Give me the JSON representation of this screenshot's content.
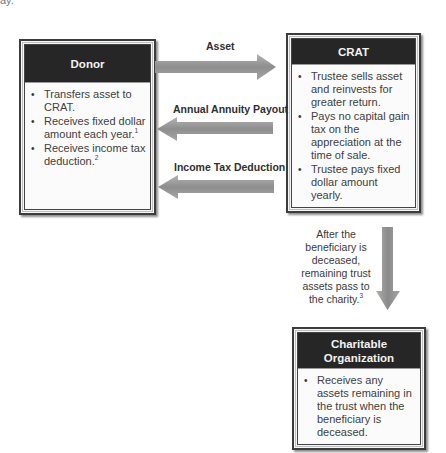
{
  "fragment_text": "ay.",
  "boxes": {
    "donor": {
      "title": "Donor",
      "items": [
        {
          "text": "Transfers asset to CRAT.",
          "sup": ""
        },
        {
          "text": "Receives fixed dollar amount each year.",
          "sup": "1"
        },
        {
          "text": "Receives income tax deduction.",
          "sup": "2"
        }
      ]
    },
    "crat": {
      "title": "CRAT",
      "items": [
        {
          "text": "Trustee sells asset and reinvests for greater return.",
          "sup": ""
        },
        {
          "text": "Pays no capital gain tax on the appreciation at the time of sale.",
          "sup": ""
        },
        {
          "text": "Trustee pays fixed dollar amount yearly.",
          "sup": ""
        }
      ]
    },
    "charity": {
      "title": "Charitable Organization",
      "items": [
        {
          "text": "Receives any assets remaining in the trust when the beneficiary is deceased.",
          "sup": ""
        }
      ]
    }
  },
  "arrows": [
    {
      "label": "Asset",
      "direction": "right",
      "from": "Donor",
      "to": "CRAT"
    },
    {
      "label": "Annual Annuity Payout",
      "direction": "left",
      "from": "CRAT",
      "to": "Donor"
    },
    {
      "label": "Income Tax Deduction",
      "direction": "left",
      "from": "CRAT",
      "to": "Donor"
    },
    {
      "label": "",
      "direction": "down",
      "from": "CRAT",
      "to": "Charitable Organization"
    }
  ],
  "flow_note": {
    "text": "After the beneficiary is deceased, remaining trust assets pass to the charity.",
    "sup": "3"
  },
  "colors": {
    "header_bg": "#262626",
    "arrow_fill": "#9a9a9a",
    "border": "#3c3c3c"
  }
}
